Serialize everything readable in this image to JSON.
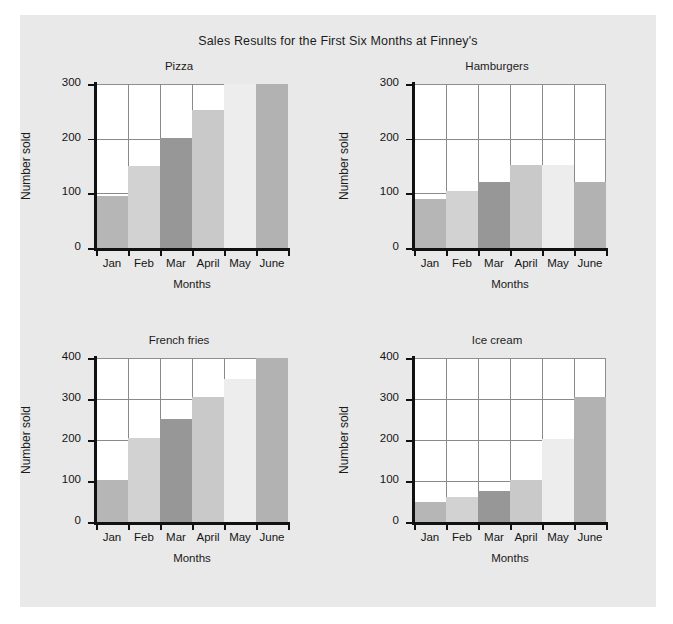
{
  "figure": {
    "title": "Sales Results for the First Six Months at Finney's",
    "page_bg": "#ffffff",
    "panel_bg": "#e9e9e9",
    "plot_bg": "#ffffff",
    "axis_color": "#111111",
    "grid_color": "#8a8a8a"
  },
  "axis_labels": {
    "x": "Months",
    "y": "Number sold"
  },
  "bar_colors": {
    "jan": "#b6b6b6",
    "feb": "#d2d2d2",
    "mar": "#979797",
    "april": "#c9c9c9",
    "may": "#ededed",
    "june": "#b2b2b2"
  },
  "chart_data": [
    {
      "type": "bar",
      "title": "Pizza",
      "xlabel": "Months",
      "ylabel": "Number sold",
      "categories": [
        "Jan",
        "Feb",
        "Mar",
        "April",
        "May",
        "June"
      ],
      "values": [
        95,
        150,
        202,
        252,
        300,
        300
      ],
      "ylim": [
        0,
        300
      ],
      "yticks": [
        0,
        100,
        200,
        300
      ],
      "ytick_labels": [
        "0",
        "100",
        "200",
        "300"
      ],
      "grid": true,
      "legend": "none",
      "bar_colors": [
        "#b6b6b6",
        "#d2d2d2",
        "#979797",
        "#c9c9c9",
        "#ededed",
        "#b2b2b2"
      ]
    },
    {
      "type": "bar",
      "title": "Hamburgers",
      "xlabel": "Months",
      "ylabel": "Number sold",
      "categories": [
        "Jan",
        "Feb",
        "Mar",
        "April",
        "May",
        "June"
      ],
      "values": [
        90,
        105,
        120,
        152,
        152,
        120
      ],
      "ylim": [
        0,
        300
      ],
      "yticks": [
        0,
        100,
        200,
        300
      ],
      "ytick_labels": [
        "0",
        "100",
        "200",
        "300"
      ],
      "grid": true,
      "legend": "none",
      "bar_colors": [
        "#b6b6b6",
        "#d2d2d2",
        "#979797",
        "#c9c9c9",
        "#ededed",
        "#b2b2b2"
      ]
    },
    {
      "type": "bar",
      "title": "French fries",
      "xlabel": "Months",
      "ylabel": "Number sold",
      "categories": [
        "Jan",
        "Feb",
        "Mar",
        "April",
        "May",
        "June"
      ],
      "values": [
        102,
        205,
        252,
        305,
        350,
        400
      ],
      "ylim": [
        0,
        400
      ],
      "yticks": [
        0,
        100,
        200,
        300,
        400
      ],
      "ytick_labels": [
        "0",
        "100",
        "200",
        "300",
        "400"
      ],
      "grid": true,
      "legend": "none",
      "bar_colors": [
        "#b6b6b6",
        "#d2d2d2",
        "#979797",
        "#c9c9c9",
        "#ededed",
        "#b2b2b2"
      ]
    },
    {
      "type": "bar",
      "title": "Ice cream",
      "xlabel": "Months",
      "ylabel": "Number sold",
      "categories": [
        "Jan",
        "Feb",
        "Mar",
        "April",
        "May",
        "June"
      ],
      "values": [
        50,
        62,
        75,
        103,
        203,
        305
      ],
      "ylim": [
        0,
        400
      ],
      "yticks": [
        0,
        100,
        200,
        300,
        400
      ],
      "ytick_labels": [
        "0",
        "100",
        "200",
        "300",
        "400"
      ],
      "grid": true,
      "legend": "none",
      "bar_colors": [
        "#b6b6b6",
        "#d2d2d2",
        "#979797",
        "#c9c9c9",
        "#ededed",
        "#b2b2b2"
      ]
    }
  ]
}
